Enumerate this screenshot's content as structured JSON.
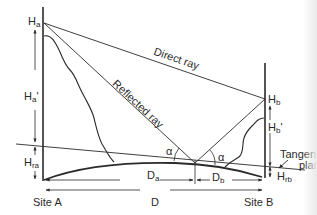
{
  "diagram": {
    "labels": {
      "Ha": {
        "main": "H",
        "sub": "a"
      },
      "Ha_prime": {
        "main": "H",
        "sub": "a",
        "suffix": "'"
      },
      "Hra": {
        "main": "H",
        "sub": "ra"
      },
      "Hb": {
        "main": "H",
        "sub": "b"
      },
      "Hb_prime": {
        "main": "H",
        "sub": "b",
        "suffix": "'"
      },
      "Hrb": {
        "main": "H",
        "sub": "rb"
      },
      "Da": {
        "main": "D",
        "sub": "a"
      },
      "Db": {
        "main": "D",
        "sub": "b"
      },
      "D": "D",
      "site_a": "Site A",
      "site_b": "Site B",
      "direct_ray": "Direct ray",
      "reflected_ray": "Reflected ray",
      "alpha_left": "α",
      "alpha_right": "α",
      "tangent_plane_line1": "Tangent",
      "tangent_plane_line2": "plane"
    },
    "colors": {
      "ink": "#2a2a2a",
      "background": "#ffffff"
    }
  }
}
